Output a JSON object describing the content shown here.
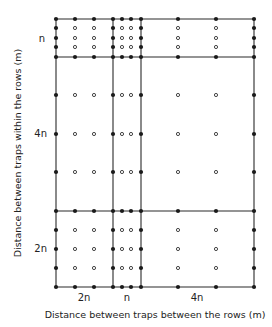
{
  "figure": {
    "x_axis": {
      "label": "Distance between traps between the rows (m)",
      "blocks": [
        {
          "label": "2n",
          "lines": [
            56,
            75,
            94,
            113
          ]
        },
        {
          "label": "n",
          "lines": [
            113,
            122,
            131,
            141
          ]
        },
        {
          "label": "4n",
          "lines": [
            141,
            178,
            216,
            254
          ]
        }
      ]
    },
    "y_axis": {
      "label": "Distance between traps within the rows (m)",
      "blocks": [
        {
          "label": "n",
          "lines": [
            19,
            28,
            38,
            47,
            57
          ]
        },
        {
          "label": "4n",
          "lines": [
            57,
            95,
            134,
            172,
            211
          ]
        },
        {
          "label": "2n",
          "lines": [
            211,
            230,
            249,
            268,
            287
          ]
        }
      ]
    },
    "legend": {
      "filled_dot": "trap on block boundary",
      "open_dot": "trap inside block"
    },
    "colors": {
      "line": "#2a2a2a",
      "dot": "#1a1a1a",
      "open_dot_stroke": "#333333",
      "background": "#ffffff"
    }
  }
}
